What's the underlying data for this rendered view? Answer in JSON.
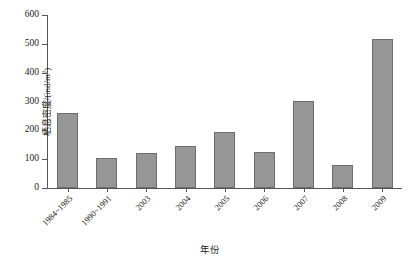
{
  "chart_data": {
    "type": "bar",
    "title": "",
    "xlabel": "年份",
    "ylabel_text": "栖息密度/(ind/m",
    "ylabel_sup": "2",
    "ylabel_tail": ")",
    "ylabel_full": "栖息密度/(ind/m2)",
    "categories": [
      "1984~1985",
      "1990~1991",
      "2003",
      "2004",
      "2005",
      "2006",
      "2007",
      "2008",
      "2009"
    ],
    "values": [
      260,
      105,
      120,
      145,
      195,
      125,
      302,
      80,
      518
    ],
    "ylim": [
      0,
      600
    ],
    "yticks": [
      0,
      100,
      200,
      300,
      400,
      500,
      600
    ],
    "ytick_labels": [
      "0",
      "100",
      "200",
      "300",
      "400",
      "500",
      "600"
    ],
    "grid": false,
    "legend": "none",
    "series_name": "栖息密度",
    "bar_color": "#969696",
    "bar_edge_color": "#6d6d6d",
    "axis_color": "#555555"
  }
}
